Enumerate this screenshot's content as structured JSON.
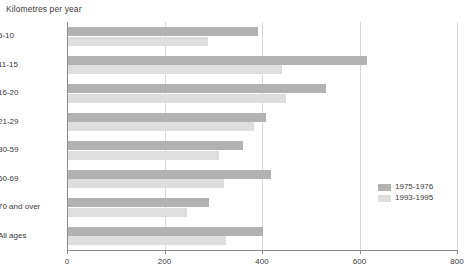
{
  "chart_data": {
    "type": "bar",
    "orientation": "horizontal",
    "title": "Kilometres per year",
    "xlabel": "",
    "ylabel": "",
    "xlim": [
      0,
      800
    ],
    "xticks": [
      0,
      200,
      400,
      600,
      800
    ],
    "grid": true,
    "legend_position": "inside-right",
    "categories": [
      "5-10",
      "11-15",
      "16-20",
      "21-29",
      "30-59",
      "60-69",
      "70 and over",
      "All ages"
    ],
    "series": [
      {
        "name": "1975-1976",
        "color": "#b2b2b2",
        "values": [
          390,
          613,
          530,
          406,
          359,
          416,
          289,
          400
        ]
      },
      {
        "name": "1993-1995",
        "color": "#dedede",
        "values": [
          287,
          439,
          447,
          381,
          310,
          320,
          244,
          324
        ]
      }
    ]
  },
  "chart": {
    "title": "Kilometres per year",
    "axis": {
      "tick_labels": [
        "0",
        "200",
        "400",
        "600",
        "800"
      ]
    },
    "categories": [
      {
        "label": "5-10"
      },
      {
        "label": "11-15"
      },
      {
        "label": "16-20"
      },
      {
        "label": "21-29"
      },
      {
        "label": "30-59"
      },
      {
        "label": "60-69"
      },
      {
        "label": "70 and over"
      },
      {
        "label": "All ages"
      }
    ],
    "legend": [
      {
        "label": "1975-1976",
        "color": "#b2b2b2"
      },
      {
        "label": "1993-1995",
        "color": "#dedede"
      }
    ]
  },
  "footnote": {
    "text": ""
  }
}
